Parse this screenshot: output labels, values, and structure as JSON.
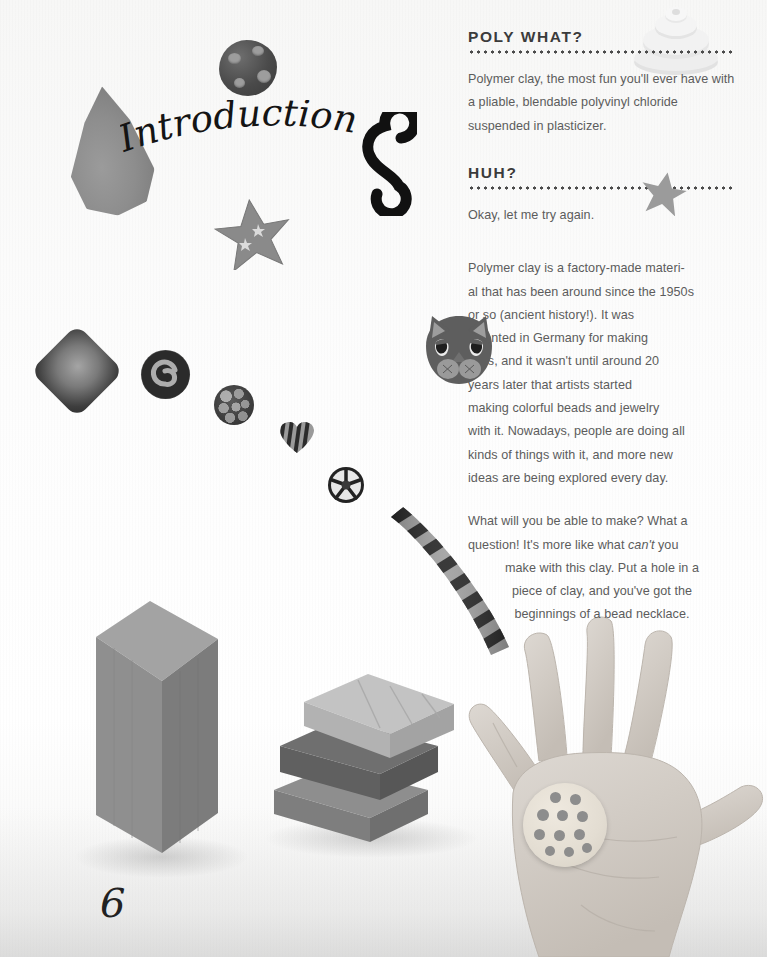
{
  "page": {
    "number": "6",
    "title_script": "Introduction",
    "background_color": "#fbfbfa",
    "heading_color": "#3b3b3b",
    "body_color": "#5c5c5c"
  },
  "sections": [
    {
      "id": "poly-what",
      "heading": "POLY WHAT?",
      "paragraphs": [
        {
          "align": "left",
          "lines": [
            "Polymer clay, the most fun you'll ever",
            "have with a pliable, blendable polyvinyl",
            "chloride suspended in plasticizer."
          ]
        }
      ]
    },
    {
      "id": "huh",
      "heading": "HUH?",
      "paragraphs": [
        {
          "align": "left",
          "lines": [
            "Okay, let me try again."
          ]
        },
        {
          "align": "wrap",
          "lines": [
            {
              "text": "Polymer clay is a factory-made materi-",
              "align": "l"
            },
            {
              "text": "al that has been around since the 1950s",
              "align": "l"
            },
            {
              "text": "or so (ancient history!). It was",
              "align": "r"
            },
            {
              "text": "invented in Germany for making",
              "align": "r"
            },
            {
              "text": "dolls, and it wasn't until around 20",
              "align": "r"
            },
            {
              "text": "years later that artists started",
              "align": "r"
            },
            {
              "text": "making colorful beads and jewelry",
              "align": "r"
            },
            {
              "text": "with it. Nowadays, people are doing all",
              "align": "l"
            },
            {
              "text": "kinds of things with it, and more new",
              "align": "l"
            },
            {
              "text": "ideas are being explored every day.",
              "align": "l"
            }
          ]
        },
        {
          "align": "center",
          "lines": [
            {
              "text": "What will you be able to make? What a",
              "align": "l"
            },
            {
              "text": "question! It's more like what ",
              "italic": "can't",
              "text_after": " you",
              "align": "l"
            },
            {
              "text": "make with this clay. Put a hole in a",
              "align": "c"
            },
            {
              "text": "piece of clay, and you've got the",
              "align": "c"
            },
            {
              "text": "beginnings of a bead necklace.",
              "align": "c"
            }
          ]
        }
      ]
    }
  ],
  "objects": [
    {
      "name": "white-concentric-disc",
      "kind": "clay-disc"
    },
    {
      "name": "gray-teardrop-cone",
      "kind": "clay-shape"
    },
    {
      "name": "spotted-round-bead",
      "kind": "bead"
    },
    {
      "name": "five-point-star-bead",
      "kind": "bead"
    },
    {
      "name": "black-s-swirl",
      "kind": "decoration"
    },
    {
      "name": "diamond-square-bead",
      "kind": "bead"
    },
    {
      "name": "spiral-round-bead",
      "kind": "bead"
    },
    {
      "name": "textured-round-bead",
      "kind": "bead"
    },
    {
      "name": "striped-heart-bead",
      "kind": "bead"
    },
    {
      "name": "wheel-flower-bead",
      "kind": "bead"
    },
    {
      "name": "twisted-two-tone-rope",
      "kind": "clay-rope"
    },
    {
      "name": "tall-clay-block",
      "kind": "clay-block"
    },
    {
      "name": "stacked-clay-blocks",
      "kind": "clay-block"
    },
    {
      "name": "open-hand-palm",
      "kind": "photo"
    },
    {
      "name": "polka-dot-clay-disc",
      "kind": "bead"
    },
    {
      "name": "gray-star-on-rule",
      "kind": "bead"
    }
  ]
}
